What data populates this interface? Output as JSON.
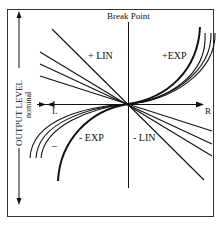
{
  "title": "Break Point",
  "axis": {
    "vertical_label": "OUTPUT LEVEL",
    "nominal_label": "nominal",
    "left_label": "L",
    "right_label": "R"
  },
  "curves": {
    "plus_lin": "+ LIN",
    "plus_exp": "+EXP",
    "minus_exp": "- EXP",
    "minus_lin": "- LIN",
    "minus_sign": "–"
  },
  "colors": {
    "line": "#111111",
    "frame": "#333333",
    "background": "#ffffff"
  }
}
